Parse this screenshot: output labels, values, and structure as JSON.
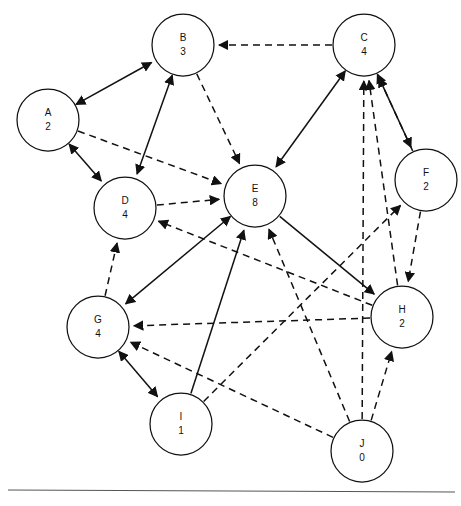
{
  "diagram": {
    "top_caption": "",
    "background_color": "#ffffff",
    "stroke_color": "#111111",
    "footer_rule_color": "#555555",
    "node_radius": 31,
    "arrow_size": 8
  },
  "chart_data": {
    "type": "diagram",
    "node_count": 10,
    "edge_count": 24,
    "nodes": [
      {
        "id": "A",
        "label": "A",
        "value": "2",
        "x": 48,
        "y": 120
      },
      {
        "id": "B",
        "label": "B",
        "value": "3",
        "x": 183,
        "y": 45
      },
      {
        "id": "C",
        "label": "C",
        "value": "4",
        "x": 364,
        "y": 45
      },
      {
        "id": "D",
        "label": "D",
        "value": "4",
        "x": 125,
        "y": 208
      },
      {
        "id": "E",
        "label": "E",
        "value": "8",
        "x": 255,
        "y": 196
      },
      {
        "id": "F",
        "label": "F",
        "value": "2",
        "x": 426,
        "y": 180
      },
      {
        "id": "G",
        "label": "G",
        "value": "4",
        "x": 98,
        "y": 327
      },
      {
        "id": "H",
        "label": "H",
        "value": "2",
        "x": 402,
        "y": 317
      },
      {
        "id": "I",
        "label": "I",
        "value": "1",
        "x": 181,
        "y": 424
      },
      {
        "id": "J",
        "label": "J",
        "value": "0",
        "x": 362,
        "y": 451
      }
    ],
    "edges": [
      {
        "from": "A",
        "to": "B",
        "style": "solid",
        "direction": "both"
      },
      {
        "from": "A",
        "to": "D",
        "style": "solid",
        "direction": "both"
      },
      {
        "from": "B",
        "to": "D",
        "style": "solid",
        "direction": "both"
      },
      {
        "from": "C",
        "to": "E",
        "style": "solid",
        "direction": "both"
      },
      {
        "from": "C",
        "to": "F",
        "style": "solid",
        "direction": "both"
      },
      {
        "from": "E",
        "to": "G",
        "style": "solid",
        "direction": "both"
      },
      {
        "from": "G",
        "to": "I",
        "style": "solid",
        "direction": "both"
      },
      {
        "from": "E",
        "to": "H",
        "style": "solid",
        "direction": "forward"
      },
      {
        "from": "I",
        "to": "E",
        "style": "solid",
        "direction": "forward"
      },
      {
        "from": "C",
        "to": "B",
        "style": "dashed",
        "direction": "forward"
      },
      {
        "from": "B",
        "to": "E",
        "style": "dashed",
        "direction": "forward"
      },
      {
        "from": "A",
        "to": "E",
        "style": "dashed",
        "direction": "forward"
      },
      {
        "from": "D",
        "to": "E",
        "style": "dashed",
        "direction": "forward"
      },
      {
        "from": "G",
        "to": "D",
        "style": "dashed",
        "direction": "forward"
      },
      {
        "from": "H",
        "to": "D",
        "style": "dashed",
        "direction": "forward"
      },
      {
        "from": "F",
        "to": "C",
        "style": "dashed",
        "direction": "forward"
      },
      {
        "from": "H",
        "to": "C",
        "style": "dashed",
        "direction": "forward"
      },
      {
        "from": "J",
        "to": "C",
        "style": "dashed",
        "direction": "forward"
      },
      {
        "from": "F",
        "to": "H",
        "style": "dashed",
        "direction": "forward"
      },
      {
        "from": "J",
        "to": "H",
        "style": "dashed",
        "direction": "forward"
      },
      {
        "from": "H",
        "to": "G",
        "style": "dashed",
        "direction": "forward"
      },
      {
        "from": "J",
        "to": "G",
        "style": "dashed",
        "direction": "forward"
      },
      {
        "from": "I",
        "to": "F",
        "style": "dashed",
        "direction": "forward"
      },
      {
        "from": "J",
        "to": "E",
        "style": "dashed",
        "direction": "forward"
      }
    ],
    "footer_rule": {
      "y": 490,
      "x1": 8,
      "x2": 455
    }
  }
}
